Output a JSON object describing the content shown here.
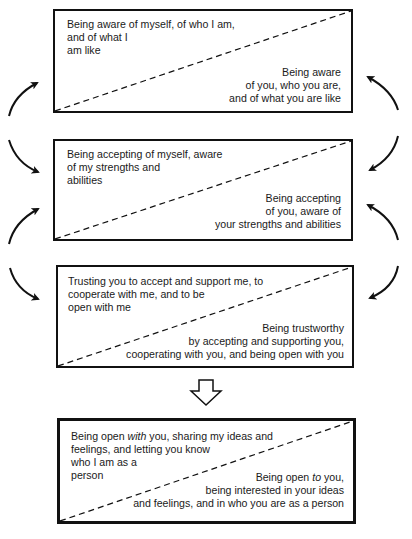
{
  "diagram": {
    "type": "flow",
    "boxes": [
      {
        "id": "awareness",
        "self_text": "Being aware of myself, of who I am,\nand of what I\nam like",
        "other_text": "Being aware\nof you, who you are,\nand of what you are like"
      },
      {
        "id": "acceptance",
        "self_text": "Being accepting of myself, aware\nof my strengths and\nabilities",
        "other_text": "Being accepting\nof you, aware of\nyour strengths and abilities"
      },
      {
        "id": "trust",
        "self_text": "Trusting you to accept and support me, to\ncooperate with me, and to be\nopen with me",
        "other_text": "Being trustworthy\nby accepting and supporting you,\ncooperating with you, and being open with you"
      },
      {
        "id": "openness",
        "self_text_parts": {
          "a": "Being open ",
          "b": "with",
          "c": " you, sharing my ideas and\nfeelings, and letting you know\nwho I am as a\nperson"
        },
        "other_text_parts": {
          "a": "Being open ",
          "b": "to",
          "c": " you,\nbeing interested in your ideas\nand feelings, and in who you are as a person"
        }
      }
    ],
    "connectors": [
      {
        "from": "acceptance",
        "to": "awareness",
        "side": "left",
        "icon": "curved-arrow-up-icon"
      },
      {
        "from": "awareness",
        "to": "acceptance",
        "side": "left",
        "icon": "curved-arrow-down-icon"
      },
      {
        "from": "acceptance",
        "to": "awareness",
        "side": "right",
        "icon": "curved-arrow-up-icon"
      },
      {
        "from": "awareness",
        "to": "acceptance",
        "side": "right",
        "icon": "curved-arrow-down-icon"
      },
      {
        "from": "trust",
        "to": "acceptance",
        "side": "left",
        "icon": "curved-arrow-up-icon"
      },
      {
        "from": "acceptance",
        "to": "trust",
        "side": "left",
        "icon": "curved-arrow-down-icon"
      },
      {
        "from": "trust",
        "to": "acceptance",
        "side": "right",
        "icon": "curved-arrow-up-icon"
      },
      {
        "from": "acceptance",
        "to": "trust",
        "side": "right",
        "icon": "curved-arrow-down-icon"
      },
      {
        "from": "trust",
        "to": "openness",
        "side": "center",
        "icon": "hollow-down-arrow-icon"
      }
    ],
    "colors": {
      "line": "#111111",
      "text": "#1a1a1a",
      "background": "#ffffff"
    }
  }
}
